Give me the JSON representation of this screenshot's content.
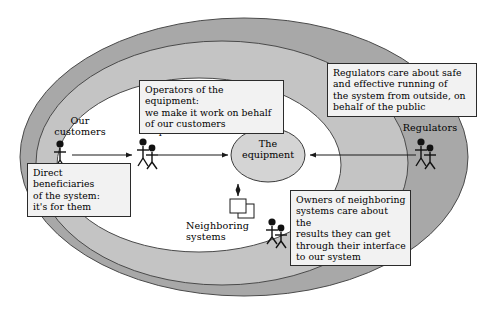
{
  "diagram": {
    "center": {
      "label": "The\nequipment",
      "shape": "ellipse",
      "fill": "#d4d4d4"
    },
    "rings": [
      {
        "name": "outer-ring",
        "fill": "#a8a8a8"
      },
      {
        "name": "middle-ring",
        "fill": "#c4c4c4"
      },
      {
        "name": "inner-ring",
        "fill": "#ffffff"
      }
    ],
    "actors": [
      {
        "name": "our-customers",
        "label": "Our\ncustomers",
        "figures": 1,
        "callout": "Direct beneficiaries\nof the system:\nit's for them"
      },
      {
        "name": "operators",
        "label": "Operators",
        "figures": 2,
        "callout": "Operators of the equipment:\nwe make it work on behalf\nof our customers"
      },
      {
        "name": "regulators",
        "label": "Regulators",
        "figures": 2,
        "callout": "Regulators care about safe\nand effective running of\nthe system from outside, on\nbehalf of the public"
      },
      {
        "name": "neighboring-systems",
        "label": "Neighboring\nsystems",
        "figures": 2,
        "callout": "Owners of neighboring\nsystems care about the\nresults they can get\nthrough their interface\nto our system"
      }
    ],
    "connectors": [
      {
        "name": "customers-to-operators",
        "direction": "right"
      },
      {
        "name": "operators-to-equipment",
        "direction": "right"
      },
      {
        "name": "regulators-to-equipment",
        "direction": "left"
      },
      {
        "name": "equipment-to-neighboring",
        "direction": "both"
      }
    ],
    "colors": {
      "outer_ring": "#a8a8a8",
      "middle_ring": "#c4c4c4",
      "inner_ring": "#ffffff",
      "center_ellipse": "#d4d4d4",
      "callout_fill": "#f2f2f2",
      "stroke": "#2b2b2b"
    }
  }
}
